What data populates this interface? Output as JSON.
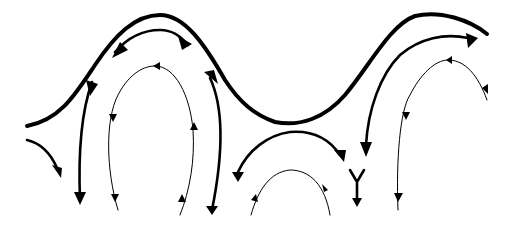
{
  "diagram": {
    "type": "streamline-flow",
    "background": "#ffffff",
    "stroke_color": "#000000",
    "boundary": {
      "name": "wavy-surface",
      "style": "thick"
    },
    "streamlines": [
      {
        "name": "left-outer-edge",
        "style": "medium",
        "arrows": 1
      },
      {
        "name": "left-crest-upper",
        "style": "medium",
        "arrows": 2
      },
      {
        "name": "left-cell-outer-left",
        "style": "medium",
        "arrows": 2
      },
      {
        "name": "left-cell-inner",
        "style": "thin",
        "arrows": 4
      },
      {
        "name": "left-cell-outer-right",
        "style": "medium",
        "arrows": 2
      },
      {
        "name": "trough-upper",
        "style": "medium",
        "arrows": 2
      },
      {
        "name": "trough-inner",
        "style": "thin",
        "arrows": 2
      },
      {
        "name": "stagnation-fork",
        "style": "medium",
        "arrows": 1
      },
      {
        "name": "right-crest-upper",
        "style": "medium",
        "arrows": 2
      },
      {
        "name": "right-cell-inner",
        "style": "thin",
        "arrows": 4
      }
    ]
  }
}
